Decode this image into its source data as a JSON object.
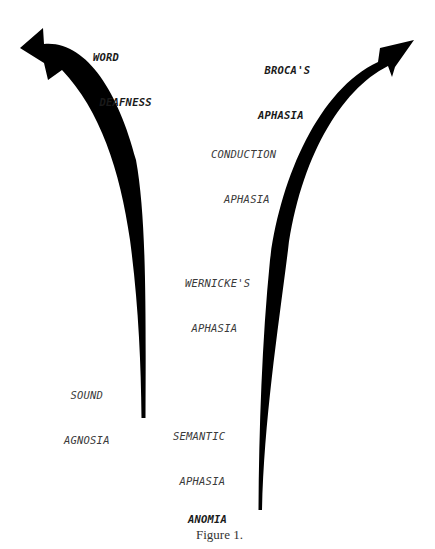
{
  "figure": {
    "caption": "Figure 1.",
    "header_partial": "",
    "arrows": [
      {
        "name": "left-arrow",
        "direction": "up-left",
        "color": "#000000"
      },
      {
        "name": "right-arrow",
        "direction": "up-right",
        "color": "#000000"
      }
    ],
    "labels": {
      "word_deafness": [
        "WORD",
        " DEAFNESS"
      ],
      "brocas_aphasia": [
        " BROCA'S",
        "APHASIA"
      ],
      "conduction_aphasia": [
        "CONDUCTION",
        "  APHASIA"
      ],
      "wernickes_aphasia": [
        "WERNICKE'S",
        " APHASIA"
      ],
      "sound_agnosia": [
        " SOUND",
        "AGNOSIA"
      ],
      "semantic_aphasia": [
        "SEMANTIC",
        " APHASIA"
      ],
      "anomia": "ANOMIA"
    }
  }
}
